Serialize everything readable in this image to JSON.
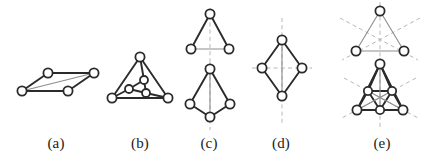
{
  "figure": {
    "width": 431,
    "height": 167,
    "background_color": "#ffffff",
    "node_fill": "#ffffff",
    "node_stroke": "#2b2b2b",
    "edge_color_dark": "#2b2b2b",
    "edge_color_light": "#8d8d8d",
    "dashed_color": "#b0b0b0",
    "caption_color": "#1a1a1a"
  },
  "captions": [
    {
      "key": "a",
      "label": "(a)",
      "center_x": 56
    },
    {
      "key": "b",
      "label": "(b)",
      "center_x": 140
    },
    {
      "key": "c",
      "label": "(c)",
      "center_x": 209
    },
    {
      "key": "d",
      "label": "(d)",
      "center_x": 281
    },
    {
      "key": "e",
      "label": "(e)",
      "center_x": 382
    }
  ],
  "panels": [
    {
      "key": "a",
      "label": "(a)",
      "name": "panel-a-parallelogram-graph",
      "left": 8,
      "width": 100,
      "height": 133,
      "view": {
        "w": 100,
        "h": 133
      },
      "nodes": [
        {
          "id": "a1",
          "x": 14,
          "y": 91,
          "r": 4.6
        },
        {
          "id": "a2",
          "x": 40,
          "y": 73,
          "r": 4.6
        },
        {
          "id": "a3",
          "x": 86,
          "y": 73,
          "r": 4.6
        },
        {
          "id": "a4",
          "x": 60,
          "y": 91,
          "r": 4.6
        }
      ],
      "edges": [
        {
          "from": "a1",
          "to": "a2",
          "tone": "dark"
        },
        {
          "from": "a2",
          "to": "a3",
          "tone": "dark"
        },
        {
          "from": "a3",
          "to": "a4",
          "tone": "dark"
        },
        {
          "from": "a4",
          "to": "a1",
          "tone": "dark"
        },
        {
          "from": "a1",
          "to": "a3",
          "tone": "light"
        }
      ],
      "dashed": []
    },
    {
      "key": "b",
      "label": "(b)",
      "name": "panel-b-nested-triangle-graph",
      "left": 100,
      "width": 80,
      "height": 133,
      "view": {
        "w": 80,
        "h": 133
      },
      "nodes": [
        {
          "id": "b1",
          "x": 40,
          "y": 57,
          "r": 4.6
        },
        {
          "id": "b2",
          "x": 12,
          "y": 98,
          "r": 4.6
        },
        {
          "id": "b3",
          "x": 68,
          "y": 98,
          "r": 4.6
        },
        {
          "id": "b4",
          "x": 44,
          "y": 80,
          "r": 4.0
        },
        {
          "id": "b5",
          "x": 29,
          "y": 89,
          "r": 4.0
        },
        {
          "id": "b6",
          "x": 46,
          "y": 93,
          "r": 4.0
        }
      ],
      "edges": [
        {
          "from": "b1",
          "to": "b2",
          "tone": "dark"
        },
        {
          "from": "b2",
          "to": "b3",
          "tone": "dark"
        },
        {
          "from": "b3",
          "to": "b1",
          "tone": "dark"
        },
        {
          "from": "b4",
          "to": "b5",
          "tone": "dark"
        },
        {
          "from": "b5",
          "to": "b6",
          "tone": "dark"
        },
        {
          "from": "b6",
          "to": "b4",
          "tone": "dark"
        },
        {
          "from": "b1",
          "to": "b4",
          "tone": "dark"
        },
        {
          "from": "b2",
          "to": "b5",
          "tone": "dark"
        },
        {
          "from": "b3",
          "to": "b6",
          "tone": "dark"
        }
      ],
      "dashed": []
    },
    {
      "key": "c",
      "label": "(c)",
      "name": "panel-c-mirror-symmetry-pair",
      "left": 181,
      "width": 58,
      "height": 133,
      "view": {
        "w": 58,
        "h": 133
      },
      "nodes": [
        {
          "id": "c1",
          "x": 29,
          "y": 14,
          "r": 4.6
        },
        {
          "id": "c2",
          "x": 10,
          "y": 49,
          "r": 4.6
        },
        {
          "id": "c3",
          "x": 48,
          "y": 49,
          "r": 4.6
        },
        {
          "id": "c4",
          "x": 29,
          "y": 69,
          "r": 4.6
        },
        {
          "id": "c5",
          "x": 9,
          "y": 104,
          "r": 4.6
        },
        {
          "id": "c6",
          "x": 49,
          "y": 104,
          "r": 4.6
        },
        {
          "id": "c7",
          "x": 29,
          "y": 117,
          "r": 4.6
        }
      ],
      "edges": [
        {
          "from": "c1",
          "to": "c2",
          "tone": "dark"
        },
        {
          "from": "c1",
          "to": "c3",
          "tone": "dark"
        },
        {
          "from": "c2",
          "to": "c3",
          "tone": "light"
        },
        {
          "from": "c4",
          "to": "c5",
          "tone": "dark"
        },
        {
          "from": "c4",
          "to": "c6",
          "tone": "dark"
        },
        {
          "from": "c5",
          "to": "c7",
          "tone": "dark"
        },
        {
          "from": "c6",
          "to": "c7",
          "tone": "dark"
        },
        {
          "from": "c4",
          "to": "c7",
          "tone": "light"
        }
      ],
      "dashed": [
        {
          "x1": 29,
          "y1": 8,
          "x2": 29,
          "y2": 62,
          "name": "mirror-axis-vertical-top"
        },
        {
          "x1": 29,
          "y1": 62,
          "x2": 29,
          "y2": 130,
          "name": "mirror-axis-vertical-bottom"
        }
      ]
    },
    {
      "key": "d",
      "label": "(d)",
      "name": "panel-d-rhombus-two-mirrors",
      "left": 250,
      "width": 64,
      "height": 133,
      "view": {
        "w": 64,
        "h": 133
      },
      "nodes": [
        {
          "id": "d1",
          "x": 32,
          "y": 40,
          "r": 4.6
        },
        {
          "id": "d2",
          "x": 12,
          "y": 68,
          "r": 4.6
        },
        {
          "id": "d3",
          "x": 52,
          "y": 68,
          "r": 4.6
        },
        {
          "id": "d4",
          "x": 32,
          "y": 96,
          "r": 4.6
        }
      ],
      "edges": [
        {
          "from": "d1",
          "to": "d2",
          "tone": "dark"
        },
        {
          "from": "d1",
          "to": "d3",
          "tone": "dark"
        },
        {
          "from": "d2",
          "to": "d4",
          "tone": "dark"
        },
        {
          "from": "d3",
          "to": "d4",
          "tone": "dark"
        },
        {
          "from": "d1",
          "to": "d4",
          "tone": "light"
        }
      ],
      "dashed": [
        {
          "x1": 32,
          "y1": 18,
          "x2": 32,
          "y2": 126,
          "name": "mirror-axis-vertical"
        },
        {
          "x1": 2,
          "y1": 68,
          "x2": 62,
          "y2": 68,
          "name": "mirror-axis-horizontal"
        }
      ]
    },
    {
      "key": "e",
      "label": "(e)",
      "name": "panel-e-threefold-symmetry-pair",
      "left": 332,
      "width": 96,
      "height": 133,
      "view": {
        "w": 96,
        "h": 133
      },
      "nodes": [
        {
          "id": "e1",
          "x": 48,
          "y": 11,
          "r": 4.6
        },
        {
          "id": "e2",
          "x": 24,
          "y": 51,
          "r": 4.6
        },
        {
          "id": "e3",
          "x": 72,
          "y": 51,
          "r": 4.6
        },
        {
          "id": "e4",
          "x": 48,
          "y": 64,
          "r": 4.6
        },
        {
          "id": "e5",
          "x": 25,
          "y": 110,
          "r": 4.6
        },
        {
          "id": "e6",
          "x": 71,
          "y": 110,
          "r": 4.6
        },
        {
          "id": "e7",
          "x": 36,
          "y": 91,
          "r": 4.2
        },
        {
          "id": "e8",
          "x": 60,
          "y": 91,
          "r": 4.2
        },
        {
          "id": "e9",
          "x": 48,
          "y": 110,
          "r": 4.2
        }
      ],
      "edges": [
        {
          "from": "e1",
          "to": "e2",
          "tone": "light"
        },
        {
          "from": "e1",
          "to": "e3",
          "tone": "light"
        },
        {
          "from": "e2",
          "to": "e3",
          "tone": "light"
        },
        {
          "from": "e4",
          "to": "e5",
          "tone": "dark"
        },
        {
          "from": "e4",
          "to": "e6",
          "tone": "dark"
        },
        {
          "from": "e5",
          "to": "e6",
          "tone": "dark"
        },
        {
          "from": "e7",
          "to": "e8",
          "tone": "dark"
        },
        {
          "from": "e8",
          "to": "e9",
          "tone": "dark"
        },
        {
          "from": "e9",
          "to": "e7",
          "tone": "dark"
        },
        {
          "from": "e4",
          "to": "e7",
          "tone": "dark"
        },
        {
          "from": "e4",
          "to": "e8",
          "tone": "dark"
        },
        {
          "from": "e4",
          "to": "e9",
          "tone": "light"
        },
        {
          "from": "e5",
          "to": "e7",
          "tone": "dark"
        },
        {
          "from": "e5",
          "to": "e9",
          "tone": "dark"
        },
        {
          "from": "e5",
          "to": "e8",
          "tone": "light"
        },
        {
          "from": "e6",
          "to": "e8",
          "tone": "dark"
        },
        {
          "from": "e6",
          "to": "e9",
          "tone": "dark"
        },
        {
          "from": "e6",
          "to": "e7",
          "tone": "light"
        }
      ],
      "dashed": [
        {
          "x1": 48,
          "y1": 2,
          "x2": 48,
          "y2": 60,
          "name": "mirror-axis-top-vertical"
        },
        {
          "x1": 8,
          "y1": 18,
          "x2": 86,
          "y2": 60,
          "name": "mirror-axis-top-diag-1"
        },
        {
          "x1": 88,
          "y1": 18,
          "x2": 10,
          "y2": 60,
          "name": "mirror-axis-top-diag-2"
        },
        {
          "x1": 48,
          "y1": 58,
          "x2": 48,
          "y2": 128,
          "name": "mirror-axis-bottom-vertical"
        },
        {
          "x1": 12,
          "y1": 78,
          "x2": 88,
          "y2": 119,
          "name": "mirror-axis-bottom-diag-1"
        },
        {
          "x1": 84,
          "y1": 78,
          "x2": 8,
          "y2": 119,
          "name": "mirror-axis-bottom-diag-2"
        }
      ]
    }
  ]
}
